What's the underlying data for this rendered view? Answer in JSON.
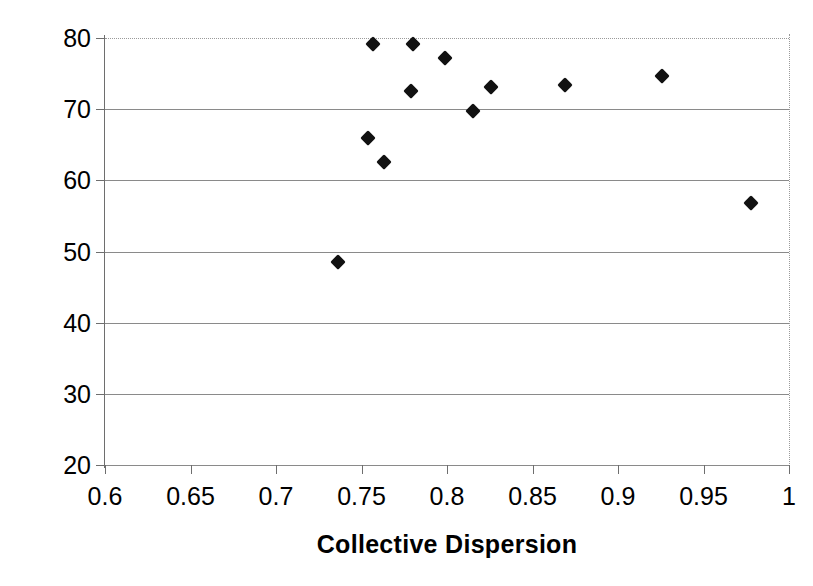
{
  "chart_data": {
    "type": "scatter",
    "title": "",
    "xlabel": "Collective Dispersion",
    "ylabel": "Collective Fitness",
    "xlim": [
      0.6,
      1.0
    ],
    "ylim": [
      20,
      80
    ],
    "xticks": [
      "0.6",
      "0.65",
      "0.7",
      "0.75",
      "0.8",
      "0.85",
      "0.9",
      "0.95",
      "1"
    ],
    "xtick_values": [
      0.6,
      0.65,
      0.7,
      0.75,
      0.8,
      0.85,
      0.9,
      0.95,
      1.0
    ],
    "yticks": [
      "20",
      "30",
      "40",
      "50",
      "60",
      "70",
      "80"
    ],
    "ytick_values": [
      20,
      30,
      40,
      50,
      60,
      70,
      80
    ],
    "grid": "horizontal",
    "legend": null,
    "marker_style": "filled-diamond",
    "marker_color": "#111111",
    "points": [
      {
        "x": 0.736,
        "y": 48.5
      },
      {
        "x": 0.754,
        "y": 65.9
      },
      {
        "x": 0.757,
        "y": 79.2
      },
      {
        "x": 0.763,
        "y": 62.6
      },
      {
        "x": 0.779,
        "y": 72.6
      },
      {
        "x": 0.78,
        "y": 79.2
      },
      {
        "x": 0.799,
        "y": 77.2
      },
      {
        "x": 0.815,
        "y": 69.8
      },
      {
        "x": 0.826,
        "y": 73.1
      },
      {
        "x": 0.869,
        "y": 73.4
      },
      {
        "x": 0.926,
        "y": 74.6
      },
      {
        "x": 0.978,
        "y": 56.8
      }
    ]
  }
}
